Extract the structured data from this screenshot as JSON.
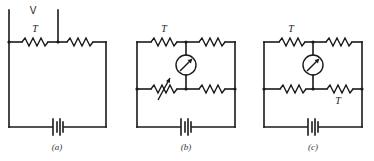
{
  "figure": {
    "panels": [
      {
        "id": "a",
        "caption": "(a)",
        "labels": {
          "voltage": "V",
          "thermistor": "T"
        }
      },
      {
        "id": "b",
        "caption": "(b)",
        "labels": {
          "thermistor": "T"
        }
      },
      {
        "id": "c",
        "caption": "(c)",
        "labels": {
          "thermistor_top": "T",
          "thermistor_bottom": "T"
        }
      }
    ],
    "colors": {
      "line": "#1a1a1a",
      "background": "#ffffff"
    }
  }
}
